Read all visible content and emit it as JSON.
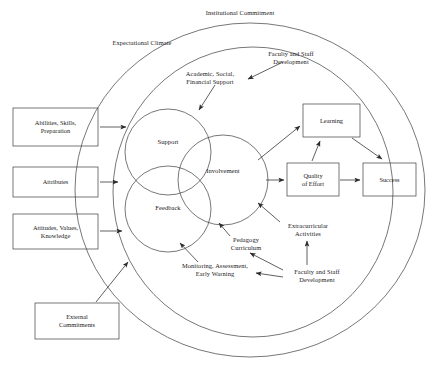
{
  "diagram": {
    "stroke_color": "#3c3c3c",
    "text_color": "#1a1a1a",
    "background": "#ffffff",
    "outer_ring_label": "Institutional Commitment",
    "inner_ring_label": "Expectational Climate",
    "venn_circles": [
      {
        "id": "support",
        "label": "Support"
      },
      {
        "id": "feedback",
        "label": "Feedback"
      },
      {
        "id": "involvement",
        "label": "Involvement"
      }
    ],
    "input_boxes": [
      {
        "id": "abilities",
        "label": "Abilities, Skills,\nPreparation"
      },
      {
        "id": "attributes",
        "label": "Attributes"
      },
      {
        "id": "attitudes",
        "label": "Attitudes, Values,\nKnowledge"
      },
      {
        "id": "external",
        "label": "External\nCommitments"
      }
    ],
    "outcome_boxes": [
      {
        "id": "learning",
        "label": "Learning"
      },
      {
        "id": "quality-of-effort",
        "label": "Quality\nof Effort"
      },
      {
        "id": "success",
        "label": "Success"
      }
    ],
    "annotations": [
      {
        "id": "academic-support",
        "label": "Academic, Social,\nFinancial Support"
      },
      {
        "id": "faculty-dev-top",
        "label": "Faculty and Staff\nDevelopment"
      },
      {
        "id": "monitoring",
        "label": "Monitoring, Assessment,\nEarly Warning"
      },
      {
        "id": "pedagogy",
        "label": "Pedagogy\nCurriculum"
      },
      {
        "id": "extracurricular",
        "label": "Extracurricular\nActivities"
      },
      {
        "id": "faculty-dev-bottom",
        "label": "Faculty and Staff\nDevelopment"
      }
    ]
  }
}
